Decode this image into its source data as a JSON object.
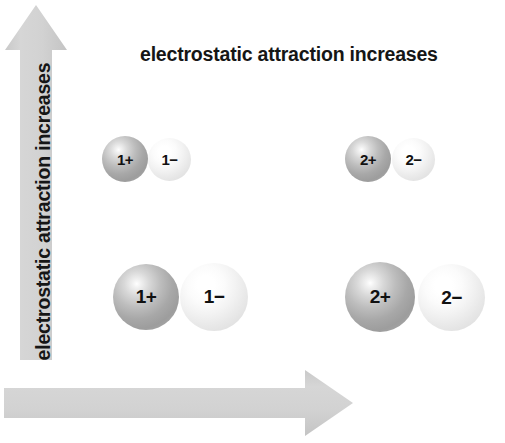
{
  "diagram": {
    "title": "electrostatic attraction increases",
    "background_color": "#ffffff",
    "arrow_color": "#d2d2d2",
    "text_color": "#161616",
    "axes": {
      "vertical": {
        "label": "electrostatic attraction increases",
        "direction": "up",
        "meaning": "decreasing ionic radius (smaller ions) increases attraction"
      },
      "horizontal": {
        "label": "electrostatic attraction increases",
        "direction": "right",
        "meaning": "increasing charge magnitude increases attraction"
      }
    },
    "ion_pairs": [
      {
        "id": "top-left",
        "row": "small-ions",
        "column": "singly-charged",
        "cation": {
          "label": "1+",
          "charge": "1+",
          "size": "small",
          "shade": "dark"
        },
        "anion": {
          "label": "1−",
          "charge": "1-",
          "size": "small",
          "shade": "light"
        }
      },
      {
        "id": "top-right",
        "row": "small-ions",
        "column": "doubly-charged",
        "cation": {
          "label": "2+",
          "charge": "2+",
          "size": "small",
          "shade": "dark"
        },
        "anion": {
          "label": "2−",
          "charge": "2-",
          "size": "small",
          "shade": "light"
        }
      },
      {
        "id": "bottom-left",
        "row": "large-ions",
        "column": "singly-charged",
        "cation": {
          "label": "1+",
          "charge": "1+",
          "size": "large",
          "shade": "dark"
        },
        "anion": {
          "label": "1−",
          "charge": "1-",
          "size": "large",
          "shade": "light"
        }
      },
      {
        "id": "bottom-right",
        "row": "large-ions",
        "column": "doubly-charged",
        "cation": {
          "label": "2+",
          "charge": "2+",
          "size": "large",
          "shade": "dark"
        },
        "anion": {
          "label": "2−",
          "charge": "2-",
          "size": "large",
          "shade": "light"
        }
      }
    ]
  }
}
